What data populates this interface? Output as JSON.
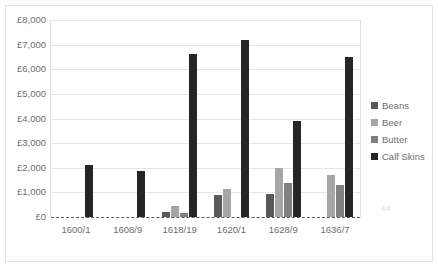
{
  "chart_data": {
    "type": "bar",
    "title": "",
    "subtitle": "",
    "xlabel": "",
    "ylabel": "",
    "categories": [
      "1600/1",
      "1608/9",
      "1618/19",
      "1620/1",
      "1628/9",
      "1636/7"
    ],
    "series": [
      {
        "name": "Beans",
        "color": "#595959",
        "values": [
          0,
          0,
          200,
          900,
          950,
          0
        ]
      },
      {
        "name": "Beer",
        "color": "#a6a6a6",
        "values": [
          0,
          0,
          450,
          1150,
          2000,
          1700
        ]
      },
      {
        "name": "Butter",
        "color": "#808080",
        "values": [
          0,
          0,
          150,
          0,
          1400,
          1300
        ]
      },
      {
        "name": "Calf Skins",
        "color": "#262626",
        "values": [
          2100,
          1850,
          6600,
          7200,
          3900,
          6500
        ]
      }
    ],
    "ylim": [
      0,
      8000
    ],
    "ytick_step": 1000,
    "ytick_labels": [
      "£0",
      "£1,000",
      "£2,000",
      "£3,000",
      "£4,000",
      "£5,000",
      "£6,000",
      "£7,000",
      "£8,000"
    ],
    "ytick_values": [
      0,
      1000,
      2000,
      3000,
      4000,
      5000,
      6000,
      7000,
      8000
    ],
    "grid": true,
    "legend_position": "right",
    "currency_symbol": "£",
    "baseline_style": "dashed"
  },
  "legend": {
    "items": [
      {
        "label": "Beans",
        "color": "#595959"
      },
      {
        "label": "Beer",
        "color": "#a6a6a6"
      },
      {
        "label": "Butter",
        "color": "#808080"
      },
      {
        "label": "Calf Skins",
        "color": "#262626"
      }
    ]
  },
  "colors": {
    "gridline": "#e6e6e6",
    "axis_text": "#6e6e6e",
    "frame": "#e3e3e3",
    "baseline": "#5a5a5a",
    "background": "#ffffff"
  },
  "artifact": {
    "mark": "4/4"
  }
}
